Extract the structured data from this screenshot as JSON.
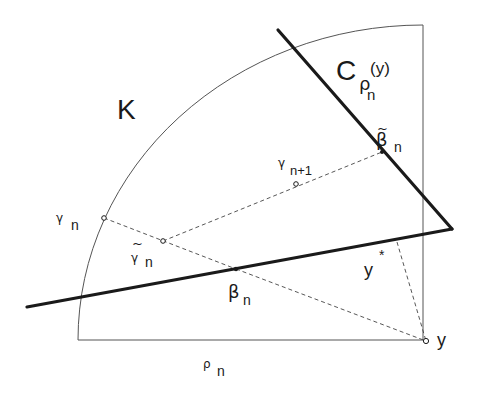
{
  "diagram": {
    "region_label": "K",
    "cone_label": {
      "base": "C",
      "sub": "ρ",
      "subsub": "n",
      "arg": "(y)"
    },
    "labels": {
      "gamma_n": {
        "sym": "γ",
        "sub": "n"
      },
      "gamma_tilde_n": {
        "tilde": "~",
        "sym": "γ",
        "sub": "n"
      },
      "gamma_n1": {
        "sym": "γ",
        "sub": "n+1"
      },
      "beta_n": {
        "sym": "β",
        "sub": "n"
      },
      "beta_tilde_n": {
        "tilde": "~",
        "sym": "β",
        "sub": "n"
      },
      "y_star": {
        "sym": "y",
        "sup": "*"
      },
      "y": "y",
      "rho_n": {
        "sym": "ρ",
        "sub": "n"
      }
    },
    "colors": {
      "ink": "#1a1a1a",
      "thin": "#555555",
      "background": "#ffffff"
    }
  }
}
